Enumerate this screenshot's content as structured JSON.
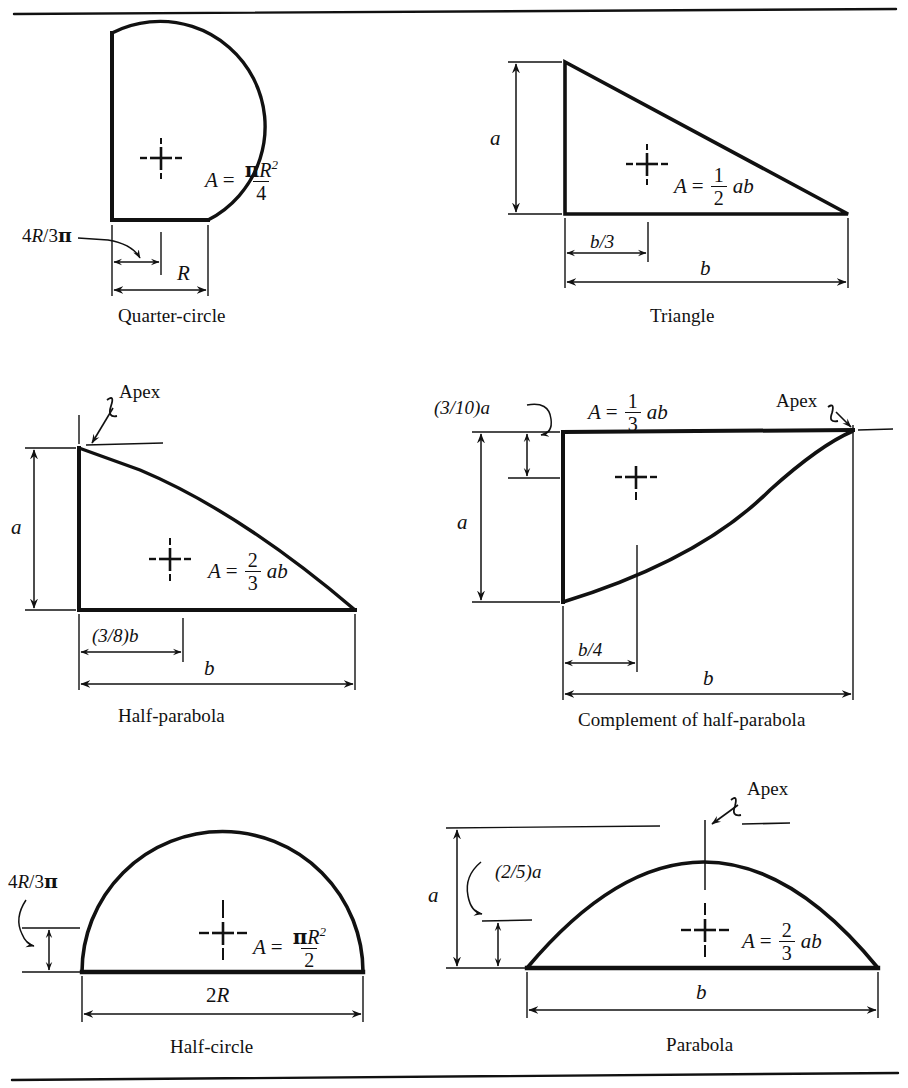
{
  "figure": {
    "kind": "centroid-reference-table",
    "top_rule": true,
    "bottom_rule": true,
    "background_color": "#ffffff",
    "ink_color": "#111111"
  },
  "panels": [
    {
      "id": "quarter-circle",
      "caption": "Quarter-circle",
      "shape": "quarter-circle",
      "area_formula": {
        "lhs": "A",
        "equals": "=",
        "numerator": "πR²",
        "denominator": "4",
        "plain": "A = πR²/4"
      },
      "dimensions": [
        {
          "name": "horizontal-centroid",
          "label": "4R/3π",
          "plain": "4R/3π"
        },
        {
          "name": "radius",
          "label": "R",
          "plain": "R"
        }
      ],
      "centroid_marker": true,
      "apex_label": null
    },
    {
      "id": "triangle",
      "caption": "Triangle",
      "shape": "right-triangle",
      "area_formula": {
        "lhs": "A",
        "equals": "=",
        "numerator": "1",
        "denominator": "2",
        "trailing": "ab",
        "plain": "A = (1/2) ab"
      },
      "dimensions": [
        {
          "name": "height",
          "label": "a",
          "plain": "a"
        },
        {
          "name": "centroid-offset",
          "label": "b/3",
          "plain": "b/3"
        },
        {
          "name": "base",
          "label": "b",
          "plain": "b"
        }
      ],
      "centroid_marker": true,
      "apex_label": null
    },
    {
      "id": "half-parabola",
      "caption": "Half-parabola",
      "shape": "half-parabola",
      "area_formula": {
        "lhs": "A",
        "equals": "=",
        "numerator": "2",
        "denominator": "3",
        "trailing": "ab",
        "plain": "A = (2/3) ab"
      },
      "dimensions": [
        {
          "name": "height",
          "label": "a",
          "plain": "a"
        },
        {
          "name": "centroid-offset",
          "label": "(3/8)b",
          "plain": "(3/8)b"
        },
        {
          "name": "base",
          "label": "b",
          "plain": "b"
        }
      ],
      "centroid_marker": true,
      "apex_label": "Apex"
    },
    {
      "id": "complement-half-parabola",
      "caption": "Complement of half-parabola",
      "shape": "complement-of-half-parabola",
      "area_formula": {
        "lhs": "A",
        "equals": "=",
        "numerator": "1",
        "denominator": "3",
        "trailing": "ab",
        "plain": "A = (1/3) ab"
      },
      "dimensions": [
        {
          "name": "vertical-centroid",
          "label": "(3/10)a",
          "plain": "(3/10)a"
        },
        {
          "name": "height",
          "label": "a",
          "plain": "a"
        },
        {
          "name": "centroid-offset",
          "label": "b/4",
          "plain": "b/4"
        },
        {
          "name": "base",
          "label": "b",
          "plain": "b"
        }
      ],
      "centroid_marker": true,
      "apex_label": "Apex"
    },
    {
      "id": "half-circle",
      "caption": "Half-circle",
      "shape": "half-circle",
      "area_formula": {
        "lhs": "A",
        "equals": "=",
        "numerator": "πR²",
        "denominator": "2",
        "plain": "A = πR²/2"
      },
      "dimensions": [
        {
          "name": "vertical-centroid",
          "label": "4R/3π",
          "plain": "4R/3π"
        },
        {
          "name": "diameter",
          "label": "2R",
          "plain": "2R"
        }
      ],
      "centroid_marker": true,
      "apex_label": null
    },
    {
      "id": "parabola",
      "caption": "Parabola",
      "shape": "parabola",
      "area_formula": {
        "lhs": "A",
        "equals": "=",
        "numerator": "2",
        "denominator": "3",
        "trailing": "ab",
        "plain": "A = (2/3) ab"
      },
      "dimensions": [
        {
          "name": "height",
          "label": "a",
          "plain": "a"
        },
        {
          "name": "vertical-centroid",
          "label": "(2/5)a",
          "plain": "(2/5)a"
        },
        {
          "name": "base",
          "label": "b",
          "plain": "b"
        }
      ],
      "centroid_marker": true,
      "apex_label": "Apex"
    }
  ],
  "glyphs": {
    "equals": "=",
    "A": "A",
    "a": "a",
    "b": "b",
    "R": "R",
    "ab": "ab",
    "pi": "π",
    "two_sup": "2",
    "four": "4",
    "two": "2",
    "three": "3",
    "one": "1",
    "b_over_3": "b/3",
    "b_over_4": "b/4",
    "two_R": "2R",
    "four_R_over_3pi": "4R/3π",
    "three_eighths_b": "(3/8)b",
    "three_tenths_a": "(3/10)a",
    "two_fifths_a": "(2/5)a",
    "apex": "Apex"
  }
}
